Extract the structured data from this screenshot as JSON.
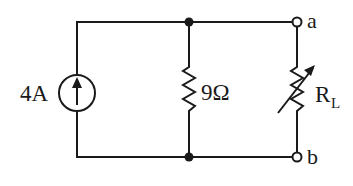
{
  "diagram": {
    "type": "circuit",
    "source": {
      "kind": "current-source",
      "label": "4A",
      "direction": "up"
    },
    "resistor": {
      "label": "9Ω"
    },
    "load": {
      "kind": "variable-resistor",
      "label_main": "R",
      "label_sub": "L"
    },
    "terminals": [
      {
        "label": "a"
      },
      {
        "label": "b"
      }
    ]
  },
  "colors": {
    "wire": "#1a1a1a",
    "background": "#ffffff"
  }
}
